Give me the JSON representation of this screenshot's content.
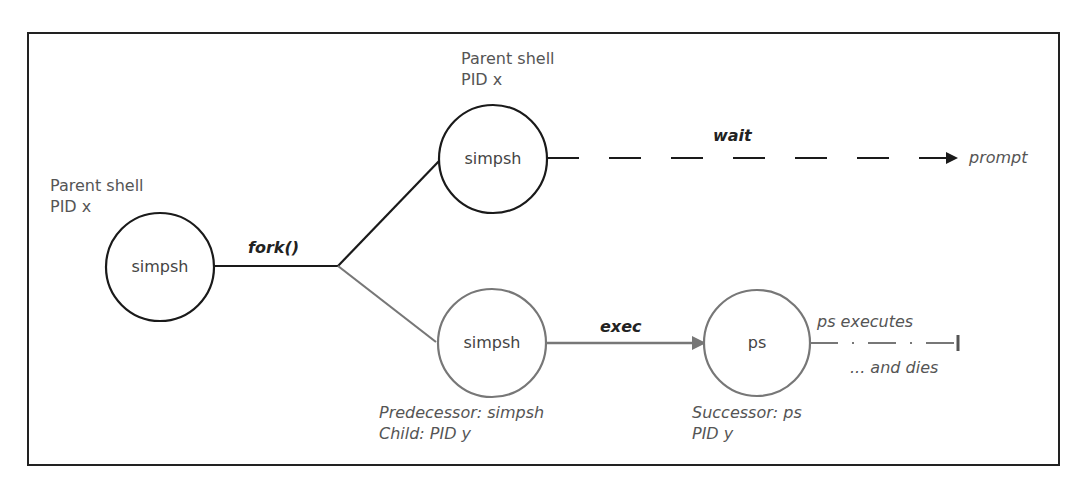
{
  "colors": {
    "frame": "#222222",
    "parent_branch": "#1a1a1a",
    "child_branch": "#777777",
    "text": "#555555",
    "bold_text": "#222222"
  },
  "nodes": {
    "parent_initial": {
      "label": "simpsh",
      "caption_line1": "Parent shell",
      "caption_line2": "PID x"
    },
    "parent_after_fork": {
      "label": "simpsh",
      "caption_line1": "Parent shell",
      "caption_line2": "PID x"
    },
    "child": {
      "label": "simpsh",
      "caption_line1": "Predecessor: simpsh",
      "caption_line2": "Child: PID y"
    },
    "successor": {
      "label": "ps",
      "caption_line1": "Successor: ps",
      "caption_line2": "PID y"
    }
  },
  "edges": {
    "fork": {
      "label": "fork()"
    },
    "wait": {
      "label": "wait",
      "end_label": "prompt"
    },
    "exec": {
      "label": "exec"
    },
    "terminate": {
      "label_top": "ps executes",
      "label_bottom": "... and dies"
    }
  }
}
